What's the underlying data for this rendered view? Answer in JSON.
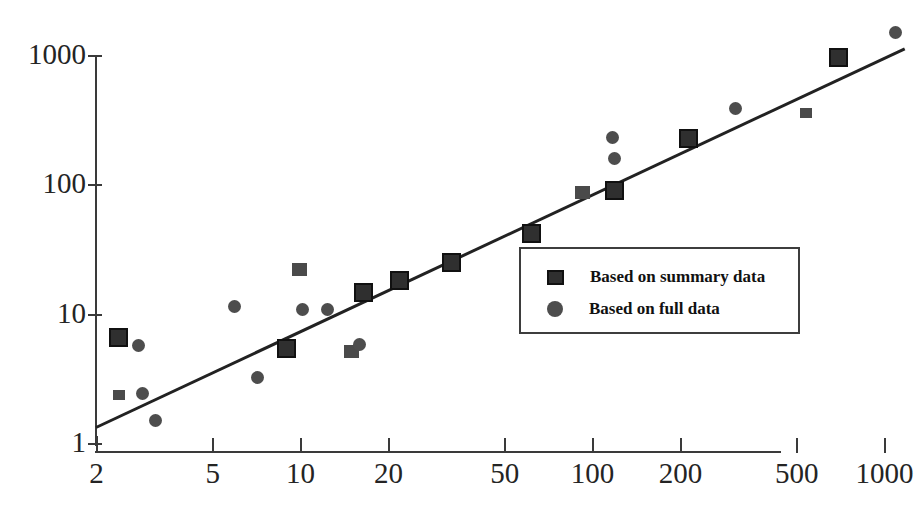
{
  "chart_data": {
    "type": "scatter",
    "title": "",
    "subtitle": "",
    "xlabel": "",
    "ylabel": "",
    "xscale": "log",
    "yscale": "log",
    "xlim": [
      2,
      1000
    ],
    "ylim": [
      1,
      1000
    ],
    "grid": false,
    "xticks": [
      2,
      5,
      10,
      20,
      50,
      100,
      200,
      500,
      1000
    ],
    "xtick_labels": [
      "2",
      "5",
      "10",
      "20",
      "50",
      "100",
      "200",
      "500",
      "1000"
    ],
    "yticks": [
      1,
      10,
      100,
      1000
    ],
    "ytick_labels": [
      "1",
      "10",
      "100",
      "1000"
    ],
    "legend": {
      "position": "center-right",
      "entries": [
        {
          "label": "Based on summary data",
          "marker": "square"
        },
        {
          "label": "Based on full data",
          "marker": "circle"
        }
      ]
    },
    "reference_line": {
      "style": "solid",
      "x": [
        2.0,
        1180
      ],
      "y": [
        1.35,
        1150
      ]
    },
    "series": [
      {
        "name": "Based on summary data",
        "marker": "square",
        "points": [
          {
            "x": 2.4,
            "y": 6.6,
            "size": "large"
          },
          {
            "x": 2.4,
            "y": 2.35,
            "size": "small"
          },
          {
            "x": 9.0,
            "y": 5.4,
            "size": "large"
          },
          {
            "x": 10.0,
            "y": 22.0,
            "size": "medium"
          },
          {
            "x": 15.0,
            "y": 5.1,
            "size": "medium"
          },
          {
            "x": 16.5,
            "y": 14.5,
            "size": "large"
          },
          {
            "x": 22.0,
            "y": 18.0,
            "size": "large"
          },
          {
            "x": 33.0,
            "y": 25.0,
            "size": "large"
          },
          {
            "x": 62.0,
            "y": 42.0,
            "size": "large"
          },
          {
            "x": 93.0,
            "y": 87.0,
            "size": "medium"
          },
          {
            "x": 120.0,
            "y": 89.0,
            "size": "large"
          },
          {
            "x": 215.0,
            "y": 225.0,
            "size": "large"
          },
          {
            "x": 540.0,
            "y": 355.0,
            "size": "small"
          },
          {
            "x": 700.0,
            "y": 960.0,
            "size": "large"
          }
        ]
      },
      {
        "name": "Based on full data",
        "marker": "circle",
        "points": [
          {
            "x": 2.8,
            "y": 5.7
          },
          {
            "x": 2.9,
            "y": 2.4
          },
          {
            "x": 3.2,
            "y": 1.5
          },
          {
            "x": 6.0,
            "y": 11.3
          },
          {
            "x": 7.2,
            "y": 3.2
          },
          {
            "x": 10.2,
            "y": 10.7
          },
          {
            "x": 12.5,
            "y": 10.7
          },
          {
            "x": 16.0,
            "y": 5.8
          },
          {
            "x": 118.0,
            "y": 230.0
          },
          {
            "x": 120.0,
            "y": 160.0
          },
          {
            "x": 310.0,
            "y": 385.0
          },
          {
            "x": 1100.0,
            "y": 1500.0
          }
        ]
      }
    ]
  }
}
